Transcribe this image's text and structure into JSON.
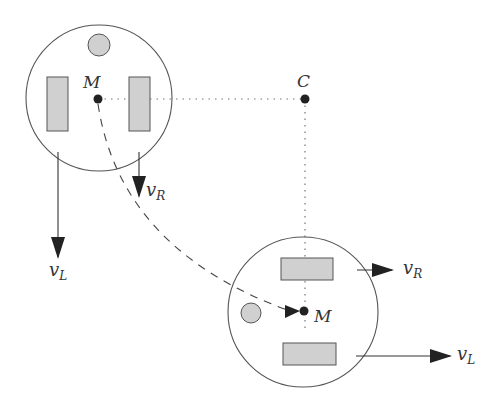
{
  "diagram": {
    "title": "",
    "colors": {
      "stroke": "#555555",
      "fill_gray": "#d0d0d0",
      "dot": "#222222",
      "arrow": "#222222",
      "text": "#333333"
    },
    "center_point": {
      "label": "C",
      "x": 305,
      "y": 99
    },
    "robot_initial": {
      "body": {
        "cx": 99,
        "cy": 98,
        "r": 73
      },
      "caster": {
        "cx": 99,
        "cy": 45,
        "r": 11
      },
      "wheel_left": {
        "x": 47,
        "y": 77,
        "w": 21,
        "h": 54
      },
      "wheel_right": {
        "x": 129,
        "y": 77,
        "w": 21,
        "h": 54
      },
      "midpoint": {
        "label": "M",
        "x": 98,
        "y": 99
      },
      "velocity_left": {
        "label_main": "v",
        "label_sub": "L",
        "x": 58,
        "y1": 152,
        "y2": 257
      },
      "velocity_right": {
        "label_main": "v",
        "label_sub": "R",
        "x": 139,
        "y1": 152,
        "y2": 196
      }
    },
    "robot_final": {
      "body": {
        "cx": 303,
        "cy": 312,
        "r": 75
      },
      "caster": {
        "cx": 251,
        "cy": 313,
        "r": 10
      },
      "wheel_top": {
        "x": 281,
        "y": 258,
        "w": 52,
        "h": 22
      },
      "wheel_bottom": {
        "x": 283,
        "y": 343,
        "w": 53,
        "h": 22
      },
      "midpoint": {
        "label": "M",
        "x": 304,
        "y": 311
      },
      "velocity_right": {
        "label_main": "v",
        "label_sub": "R",
        "y": 270,
        "x1": 357,
        "x2": 392
      },
      "velocity_left": {
        "label_main": "v",
        "label_sub": "L",
        "y": 356,
        "x1": 356,
        "x2": 450
      }
    },
    "trajectory": {
      "style": "dashed",
      "description": "arc from initial M to final M"
    },
    "radius_lines": {
      "style": "dotted"
    }
  }
}
